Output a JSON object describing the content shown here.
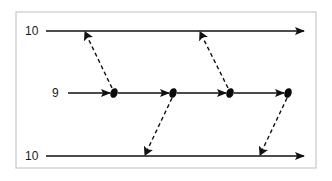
{
  "diagram": {
    "frame": {
      "x": 16,
      "y": 12,
      "width": 300,
      "height": 156,
      "border_color": "#c8c8c8"
    },
    "lines": [
      {
        "id": "top",
        "label": "10",
        "y": 31,
        "x_start": 46,
        "x_end": 304
      },
      {
        "id": "middle",
        "label": "9",
        "y": 93,
        "x_start": 68,
        "x_end": 288
      },
      {
        "id": "bottom",
        "label": "10",
        "y": 156,
        "x_start": 46,
        "x_end": 304
      }
    ],
    "nodes": [
      {
        "x": 114,
        "y": 93
      },
      {
        "x": 173,
        "y": 93
      },
      {
        "x": 230,
        "y": 93
      },
      {
        "x": 288,
        "y": 93
      }
    ],
    "dashed_arrows": [
      {
        "from_node": 0,
        "to": "top",
        "tip_x": 85,
        "tip_y": 32
      },
      {
        "from_node": 2,
        "to": "top",
        "tip_x": 200,
        "tip_y": 32
      },
      {
        "from_node": 1,
        "to": "bottom",
        "tip_x": 145,
        "tip_y": 155
      },
      {
        "from_node": 3,
        "to": "bottom",
        "tip_x": 260,
        "tip_y": 155
      }
    ],
    "stroke_color": "#111111"
  }
}
